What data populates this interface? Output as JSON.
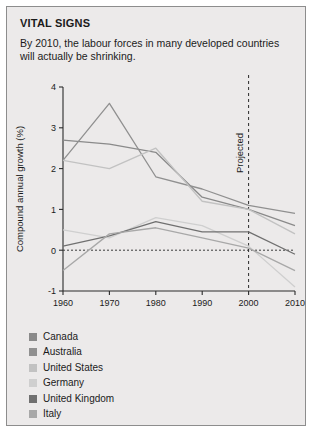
{
  "card": {
    "title": "VITAL SIGNS",
    "subtitle": "By 2010, the labour forces in many developed countries will actually be shrinking."
  },
  "chart_data": {
    "type": "line",
    "title": "",
    "xlabel": "",
    "ylabel": "Compound annual growth (%)",
    "x": [
      1960,
      1970,
      1980,
      1990,
      2000,
      2010
    ],
    "xticklabels": [
      "1960",
      "1970",
      "1980",
      "1990",
      "2000",
      "2010"
    ],
    "yticklabels": [
      "-1",
      "0",
      "1",
      "2",
      "3",
      "4"
    ],
    "ylim": [
      -1,
      4
    ],
    "xlim": [
      1960,
      2010
    ],
    "grid": false,
    "legend_position": "below",
    "zero_line": 0,
    "annotations": [
      {
        "text": "Projected",
        "x": 2000,
        "orientation": "vertical",
        "line": "dashed"
      }
    ],
    "series": [
      {
        "name": "Canada",
        "color": "#8a8a8a",
        "values": [
          2.7,
          2.6,
          2.4,
          1.3,
          1.0,
          0.6
        ]
      },
      {
        "name": "Australia",
        "color": "#909090",
        "values": [
          2.2,
          3.6,
          1.8,
          1.5,
          1.1,
          0.9
        ]
      },
      {
        "name": "United States",
        "color": "#c2c2c2",
        "values": [
          2.2,
          2.0,
          2.5,
          1.2,
          1.0,
          0.4
        ]
      },
      {
        "name": "Germany",
        "color": "#cfcfcf",
        "values": [
          0.5,
          0.3,
          0.8,
          0.6,
          0.1,
          -0.9
        ]
      },
      {
        "name": "United Kingdom",
        "color": "#707070",
        "values": [
          0.1,
          0.35,
          0.7,
          0.45,
          0.45,
          -0.1
        ]
      },
      {
        "name": "Italy",
        "color": "#a8a8a8",
        "values": [
          -0.5,
          0.4,
          0.55,
          0.3,
          0.05,
          -0.5
        ]
      }
    ]
  },
  "legend": {
    "items": [
      {
        "label": "Canada",
        "color": "#8a8a8a"
      },
      {
        "label": "Australia",
        "color": "#909090"
      },
      {
        "label": "United States",
        "color": "#c2c2c2"
      },
      {
        "label": "Germany",
        "color": "#cfcfcf"
      },
      {
        "label": "United Kingdom",
        "color": "#707070"
      },
      {
        "label": "Italy",
        "color": "#a8a8a8"
      }
    ]
  }
}
